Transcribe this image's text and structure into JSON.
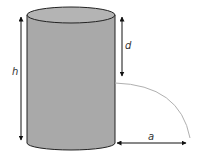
{
  "diagram": {
    "type": "cylinder-water-jet",
    "labels": {
      "height": "h",
      "depth": "d",
      "distance": "a"
    },
    "colors": {
      "cylinder_fill": "#a9a9a9",
      "cylinder_top": "#b4b4b4",
      "outline": "#222222",
      "arc": "#b0b0b0",
      "arrow": "#111111"
    }
  }
}
